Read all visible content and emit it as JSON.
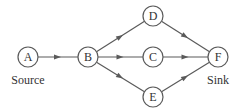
{
  "diagram": {
    "type": "directed-flow-network",
    "colors": {
      "edge": "#5a5a5a",
      "node_stroke": "#5a5a5a",
      "node_fill": "#ffffff",
      "text": "#333333"
    },
    "node_radius": 10,
    "nodes": [
      {
        "id": "A",
        "label": "A",
        "x": 28,
        "y": 57
      },
      {
        "id": "B",
        "label": "B",
        "x": 88,
        "y": 57
      },
      {
        "id": "C",
        "label": "C",
        "x": 153,
        "y": 57
      },
      {
        "id": "D",
        "label": "D",
        "x": 153,
        "y": 16
      },
      {
        "id": "E",
        "label": "E",
        "x": 153,
        "y": 97
      },
      {
        "id": "F",
        "label": "F",
        "x": 218,
        "y": 57
      }
    ],
    "edges": [
      {
        "from": "A",
        "to": "B"
      },
      {
        "from": "B",
        "to": "D"
      },
      {
        "from": "B",
        "to": "C"
      },
      {
        "from": "B",
        "to": "E"
      },
      {
        "from": "D",
        "to": "F"
      },
      {
        "from": "C",
        "to": "F"
      },
      {
        "from": "E",
        "to": "F"
      }
    ],
    "captions": {
      "source": {
        "text": "Source",
        "x": 28,
        "y": 84
      },
      "sink": {
        "text": "Sink",
        "x": 218,
        "y": 84
      }
    }
  }
}
